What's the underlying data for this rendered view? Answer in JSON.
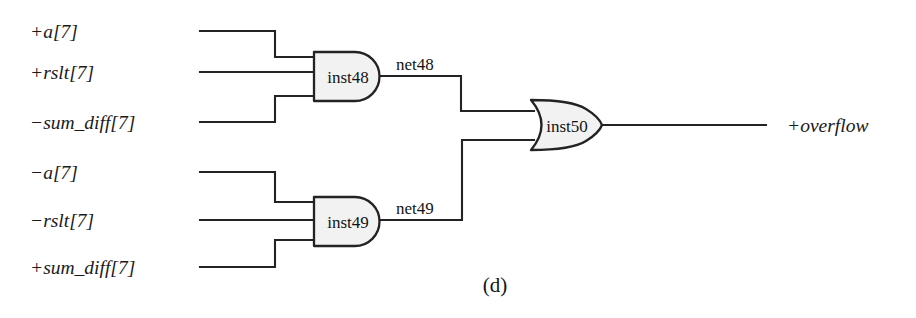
{
  "figure": {
    "caption": "(d)",
    "background_color": "#ffffff",
    "line_color": "#232323",
    "gate_fill_color": "#f2f2f2"
  },
  "inputs": [
    {
      "label": "+a[7]",
      "target_gate": "inst48",
      "pin": "top"
    },
    {
      "label": "+rslt[7]",
      "target_gate": "inst48",
      "pin": "middle"
    },
    {
      "label": "−sum_diff[7]",
      "target_gate": "inst48",
      "pin": "bottom"
    },
    {
      "label": "−a[7]",
      "target_gate": "inst49",
      "pin": "top"
    },
    {
      "label": "−rslt[7]",
      "target_gate": "inst49",
      "pin": "middle"
    },
    {
      "label": "+sum_diff[7]",
      "target_gate": "inst49",
      "pin": "bottom"
    }
  ],
  "gates": [
    {
      "id": "inst48",
      "label": "inst48",
      "type": "and",
      "inputs": 3
    },
    {
      "id": "inst49",
      "label": "inst49",
      "type": "and",
      "inputs": 3
    },
    {
      "id": "inst50",
      "label": "inst50",
      "type": "or",
      "inputs": 2
    }
  ],
  "nets": [
    {
      "label": "net48",
      "from": "inst48",
      "to": "inst50"
    },
    {
      "label": "net49",
      "from": "inst49",
      "to": "inst50"
    }
  ],
  "outputs": [
    {
      "label": "+overflow",
      "from": "inst50"
    }
  ]
}
